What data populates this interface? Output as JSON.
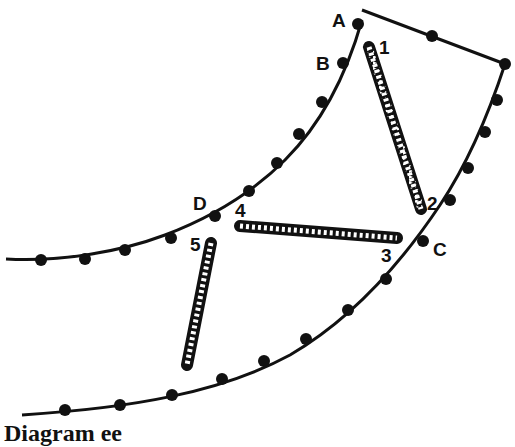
{
  "diagram": {
    "caption": "Diagram ee",
    "point_labels": {
      "A": "A",
      "B": "B",
      "C": "C",
      "D": "D"
    },
    "element_labels": [
      "1",
      "2",
      "3",
      "4",
      "5"
    ],
    "colors": {
      "line": "#111111",
      "background": "#ffffff"
    },
    "springs": [
      {
        "id": "spring-1-2",
        "from": "1",
        "to": "2"
      },
      {
        "id": "spring-4-3",
        "from": "4",
        "to": "3"
      },
      {
        "id": "spring-5",
        "from": "5",
        "to": ""
      }
    ]
  }
}
